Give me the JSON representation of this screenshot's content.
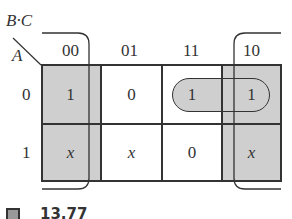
{
  "kmap": {
    "var_top": "B·C",
    "var_left": "A",
    "col_headers": [
      "00",
      "01",
      "11",
      "10"
    ],
    "row_headers": [
      "0",
      "1"
    ],
    "cells": [
      [
        "1",
        "0",
        "1",
        "1"
      ],
      [
        "x",
        "x",
        "0",
        "x"
      ]
    ],
    "shaded_cells": [
      [
        0,
        0
      ],
      [
        1,
        0
      ],
      [
        0,
        3
      ],
      [
        1,
        3
      ]
    ],
    "groups": [
      {
        "name": "corner-group",
        "cells": [
          [
            0,
            0
          ],
          [
            1,
            0
          ],
          [
            0,
            3
          ],
          [
            1,
            3
          ]
        ],
        "style": "wrap-around bracket"
      },
      {
        "name": "pill-group",
        "cells": [
          [
            0,
            2
          ],
          [
            0,
            3
          ]
        ],
        "style": "rounded loop"
      }
    ],
    "colors": {
      "shade": "#cfcfcf",
      "line": "#333333"
    }
  },
  "caption": {
    "text": "13.77"
  }
}
